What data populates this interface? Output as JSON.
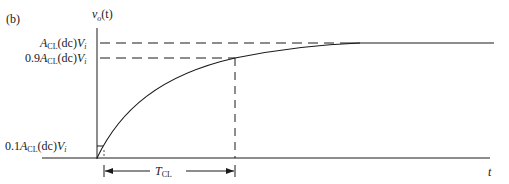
{
  "figure": {
    "panel_label": "(b)",
    "y_axis_label": {
      "v": "v",
      "sub": "o",
      "arg": "(t)"
    },
    "x_axis_label": "t",
    "levels": {
      "final": {
        "prefix": "",
        "A": "A",
        "sub": "CL",
        "mid": "(dc)",
        "V": "V",
        "vsub": "i"
      },
      "ninety": {
        "prefix": "0.9",
        "A": "A",
        "sub": "CL",
        "mid": "(dc)",
        "V": "V",
        "vsub": "i"
      },
      "ten": {
        "prefix": "0.1",
        "A": "A",
        "sub": "CL",
        "mid": "(dc)",
        "V": "V",
        "vsub": "i"
      }
    },
    "time_constant": {
      "T": "T",
      "sub": "CL"
    },
    "line_color": "#1a1a1a"
  }
}
